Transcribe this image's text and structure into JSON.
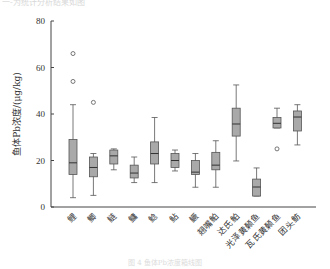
{
  "page": {
    "top_text": "一-为统计分析结果如图",
    "caption": "图 4 鱼体Pb浓度箱线图"
  },
  "chart_data": {
    "type": "box",
    "title": "",
    "xlabel": "",
    "ylabel": "鱼体Pb浓度/(μg/kg)",
    "ylim": [
      0,
      80
    ],
    "yticks": [
      0,
      20,
      40,
      60,
      80
    ],
    "grid": false,
    "categories": [
      "鲤",
      "鲫",
      "鲢",
      "鳙",
      "鲶",
      "鲇",
      "鳜",
      "翘嘴鲌",
      "达氏鲌",
      "光泽黄颡鱼",
      "瓦氏黄颡鱼",
      "团头鲂"
    ],
    "boxes": [
      {
        "name": "鲤",
        "min": 4,
        "q1": 14,
        "median": 19,
        "q3": 29,
        "max": 44,
        "outliers": [
          54,
          66
        ]
      },
      {
        "name": "鲫",
        "min": 5,
        "q1": 13,
        "median": 17,
        "q3": 21.5,
        "max": 23,
        "outliers": [
          45
        ]
      },
      {
        "name": "鲢",
        "min": 16,
        "q1": 18.5,
        "median": 22,
        "q3": 24.5,
        "max": 25,
        "outliers": []
      },
      {
        "name": "鳙",
        "min": 10.5,
        "q1": 12.5,
        "median": 14.6,
        "q3": 18,
        "max": 21.5,
        "outliers": []
      },
      {
        "name": "鲶",
        "min": 10.5,
        "q1": 18.5,
        "median": 23,
        "q3": 28,
        "max": 38.5,
        "outliers": []
      },
      {
        "name": "鲇",
        "min": 15.5,
        "q1": 17,
        "median": 20,
        "q3": 23,
        "max": 24.5,
        "outliers": []
      },
      {
        "name": "鳜",
        "min": 8.5,
        "q1": 14,
        "median": 15,
        "q3": 20,
        "max": 23,
        "outliers": []
      },
      {
        "name": "翘嘴鲌",
        "min": 8.5,
        "q1": 16,
        "median": 18,
        "q3": 23.5,
        "max": 28.5,
        "outliers": []
      },
      {
        "name": "达氏鲌",
        "min": 19.8,
        "q1": 30.5,
        "median": 35.7,
        "q3": 42.5,
        "max": 52.5,
        "outliers": []
      },
      {
        "name": "光泽黄颡鱼",
        "min": 4.7,
        "q1": 4.7,
        "median": 8.6,
        "q3": 12,
        "max": 16.8,
        "outliers": []
      },
      {
        "name": "瓦氏黄颡鱼",
        "min": 34,
        "q1": 34,
        "median": 36,
        "q3": 38.5,
        "max": 42.5,
        "outliers": [
          25
        ]
      },
      {
        "name": "团头鲂",
        "min": 26.7,
        "q1": 32.7,
        "median": 38.7,
        "q3": 41.3,
        "max": 44,
        "outliers": []
      }
    ],
    "colors": {
      "box_fill": "#a9a9a9",
      "box_stroke": "#555555",
      "axis": "#444444"
    }
  }
}
